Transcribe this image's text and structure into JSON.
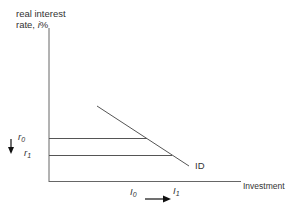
{
  "diagram": {
    "type": "investment-demand",
    "y_axis_label_line1": "real interest",
    "y_axis_label_line2_prefix": "rate, ",
    "y_axis_label_line2_var": "i",
    "y_axis_label_line2_suffix": "%",
    "x_axis_label": "Investment",
    "curve_label": "ID",
    "r0": {
      "var": "r",
      "sub": "0"
    },
    "r1": {
      "var": "r",
      "sub": "1"
    },
    "I0": {
      "var": "I",
      "sub": "0"
    },
    "I1": {
      "var": "I",
      "sub": "1"
    },
    "colors": {
      "line": "#555555",
      "text": "#333333",
      "arrow": "#111111"
    }
  }
}
